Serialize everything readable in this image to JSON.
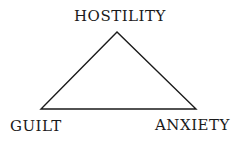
{
  "diagram": {
    "type": "triangle",
    "labels": {
      "top": "HOSTILITY",
      "bottom_left": "GUILT",
      "bottom_right": "ANXIETY"
    },
    "line_color": "#1a1a1a"
  }
}
